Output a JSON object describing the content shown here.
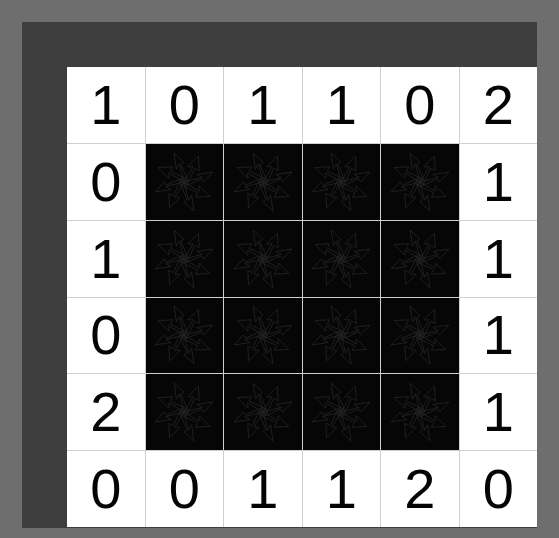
{
  "board": {
    "title": "number grid puzzle board",
    "rows": 6,
    "columns": 6,
    "colors": {
      "outer_background": "#6e6e6e",
      "frame": "#3d3d3d",
      "cell_empty": "#ffffff",
      "cell_filled": "#060606",
      "grid_line": "#cfcfcf",
      "number": "#050505",
      "star_outline": "#222222"
    },
    "filled_icon_name": "chaos-star-icon",
    "cells": [
      [
        {
          "value": "1",
          "filled": false
        },
        {
          "value": "0",
          "filled": false
        },
        {
          "value": "1",
          "filled": false
        },
        {
          "value": "1",
          "filled": false
        },
        {
          "value": "0",
          "filled": false
        },
        {
          "value": "2",
          "filled": false
        }
      ],
      [
        {
          "value": "0",
          "filled": false
        },
        {
          "value": "",
          "filled": true
        },
        {
          "value": "",
          "filled": true
        },
        {
          "value": "",
          "filled": true
        },
        {
          "value": "",
          "filled": true
        },
        {
          "value": "1",
          "filled": false
        }
      ],
      [
        {
          "value": "1",
          "filled": false
        },
        {
          "value": "",
          "filled": true
        },
        {
          "value": "",
          "filled": true
        },
        {
          "value": "",
          "filled": true
        },
        {
          "value": "",
          "filled": true
        },
        {
          "value": "1",
          "filled": false
        }
      ],
      [
        {
          "value": "0",
          "filled": false
        },
        {
          "value": "",
          "filled": true
        },
        {
          "value": "",
          "filled": true
        },
        {
          "value": "",
          "filled": true
        },
        {
          "value": "",
          "filled": true
        },
        {
          "value": "1",
          "filled": false
        }
      ],
      [
        {
          "value": "2",
          "filled": false
        },
        {
          "value": "",
          "filled": true
        },
        {
          "value": "",
          "filled": true
        },
        {
          "value": "",
          "filled": true
        },
        {
          "value": "",
          "filled": true
        },
        {
          "value": "1",
          "filled": false
        }
      ],
      [
        {
          "value": "0",
          "filled": false
        },
        {
          "value": "0",
          "filled": false
        },
        {
          "value": "1",
          "filled": false
        },
        {
          "value": "1",
          "filled": false
        },
        {
          "value": "2",
          "filled": false
        },
        {
          "value": "0",
          "filled": false
        }
      ]
    ],
    "top_row_values": [
      "1",
      "0",
      "1",
      "1",
      "0",
      "2"
    ],
    "bottom_row_values": [
      "0",
      "0",
      "1",
      "1",
      "2",
      "0"
    ],
    "left_column_values": [
      "1",
      "0",
      "1",
      "0",
      "2",
      "0"
    ],
    "right_column_values": [
      "2",
      "1",
      "1",
      "1",
      "1",
      "0"
    ]
  }
}
